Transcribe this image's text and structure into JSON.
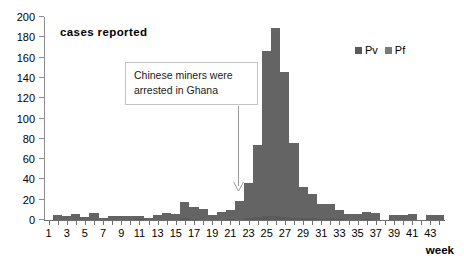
{
  "chart_data": {
    "type": "bar",
    "title": "",
    "subtitle": "",
    "xlabel": "week",
    "ylabel": "cases reported",
    "stacked": true,
    "grid": false,
    "legend_position": "top-right",
    "xlim": [
      1,
      44
    ],
    "ylim": [
      0,
      200
    ],
    "yticks": [
      0,
      20,
      40,
      60,
      80,
      100,
      120,
      140,
      160,
      180,
      200
    ],
    "xticks": [
      1,
      3,
      5,
      7,
      9,
      11,
      13,
      15,
      17,
      19,
      21,
      23,
      25,
      27,
      29,
      31,
      33,
      35,
      37,
      39,
      41,
      43
    ],
    "categories": [
      1,
      2,
      3,
      4,
      5,
      6,
      7,
      8,
      9,
      10,
      11,
      12,
      13,
      14,
      15,
      16,
      17,
      18,
      19,
      20,
      21,
      22,
      23,
      24,
      25,
      26,
      27,
      28,
      29,
      30,
      31,
      32,
      33,
      34,
      35,
      36,
      37,
      38,
      39,
      40,
      41,
      42,
      43,
      44
    ],
    "series": [
      {
        "name": "Pv",
        "color": "#5a5a5a",
        "values": [
          0,
          0,
          0,
          0,
          0,
          0,
          0,
          0,
          0,
          0,
          1,
          0,
          0,
          0,
          0,
          2,
          1,
          0,
          0,
          0,
          1,
          0,
          2,
          3,
          4,
          4,
          3,
          2,
          2,
          2,
          1,
          2,
          1,
          0,
          0,
          1,
          0,
          0,
          0,
          0,
          0,
          0,
          0,
          0
        ]
      },
      {
        "name": "Pf",
        "color": "#646464",
        "values": [
          0,
          5,
          4,
          6,
          3,
          7,
          2,
          4,
          4,
          4,
          3,
          2,
          5,
          7,
          6,
          16,
          12,
          11,
          5,
          8,
          9,
          19,
          34,
          71,
          163,
          185,
          143,
          74,
          31,
          24,
          15,
          14,
          9,
          6,
          6,
          7,
          7,
          0,
          5,
          5,
          6,
          0,
          5,
          5
        ]
      }
    ],
    "totals": [
      0,
      5,
      4,
      6,
      3,
      7,
      2,
      4,
      4,
      4,
      4,
      2,
      5,
      7,
      6,
      18,
      13,
      11,
      5,
      8,
      10,
      19,
      36,
      74,
      167,
      189,
      146,
      76,
      33,
      26,
      16,
      16,
      10,
      6,
      6,
      8,
      7,
      0,
      5,
      5,
      6,
      0,
      5,
      5
    ],
    "annotations": [
      {
        "text_lines": [
          "Chinese miners were",
          "arrested in Ghana"
        ],
        "points_to_week": 22,
        "arrow": "down"
      }
    ]
  },
  "legend": {
    "items": [
      {
        "label": "Pv",
        "color": "#5a5a5a"
      },
      {
        "label": "Pf",
        "color": "#7a7a7a"
      }
    ]
  },
  "axes": {
    "y_title": "cases reported",
    "x_title": "week"
  }
}
